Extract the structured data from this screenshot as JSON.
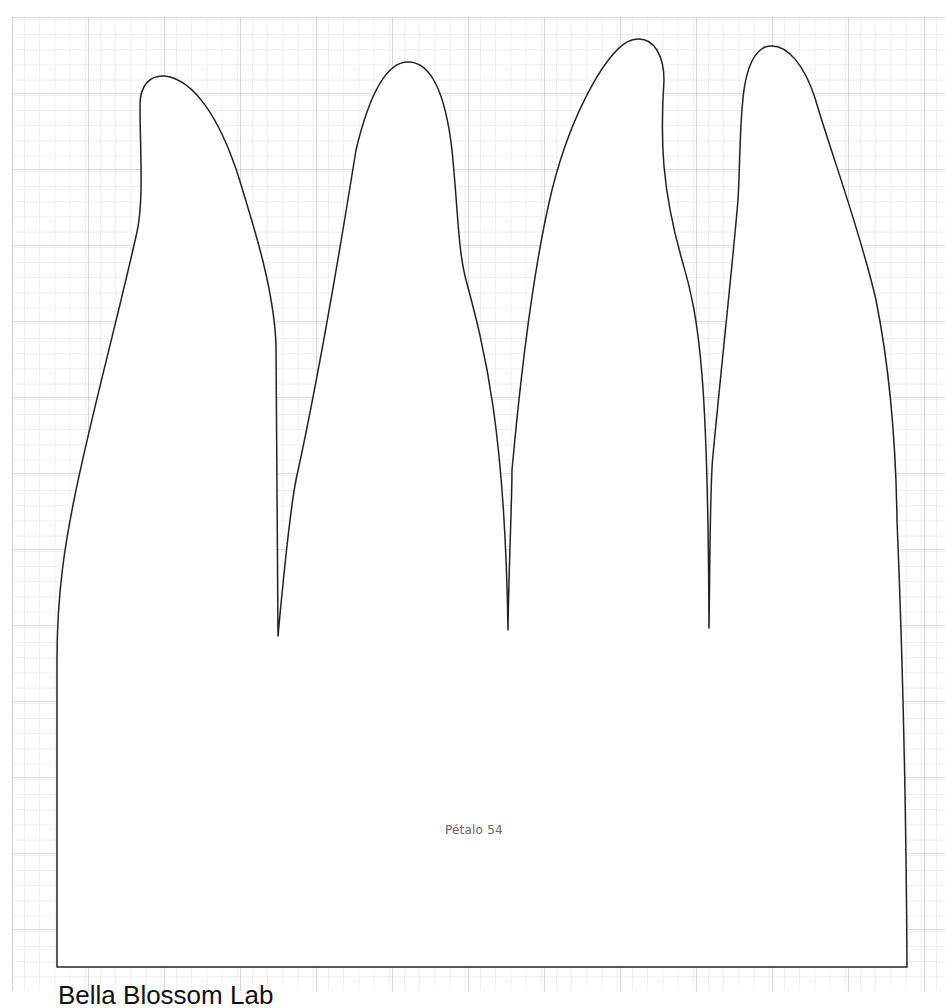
{
  "sheet": {
    "background": "#ffffff",
    "grid": {
      "origin_x": 12,
      "origin_y": 17,
      "minor_spacing": 15.2,
      "major_every": 5,
      "minor_color": "#dedede",
      "major_color": "#bdbdbd"
    }
  },
  "template": {
    "label": "Pétalo 54",
    "outline_color": "#222222",
    "fill_color": "#ffffff",
    "petal_count": 4
  },
  "footer": {
    "text": "Bella Blossom Lab"
  }
}
